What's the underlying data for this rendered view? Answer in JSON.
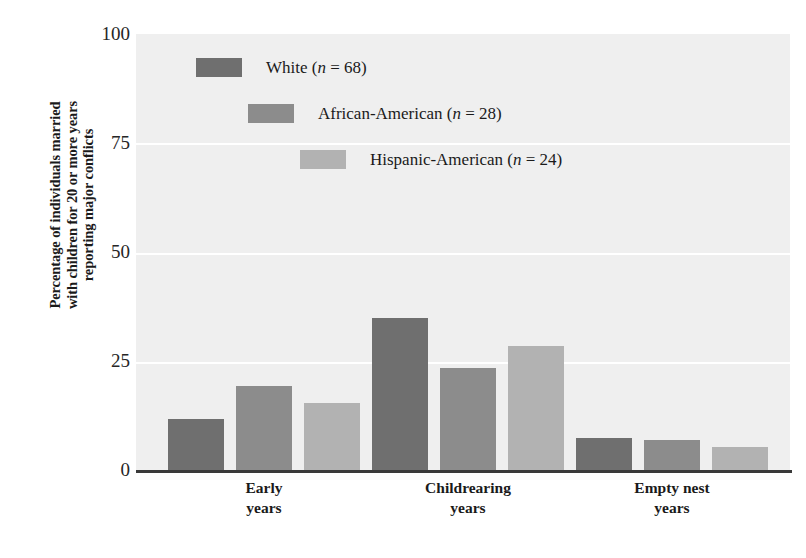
{
  "chart_data": {
    "type": "bar",
    "title": "",
    "subtitle": "",
    "xlabel": "",
    "ylabel": "Percentage of individuals married with children for 20 or more years reporting major conflicts",
    "ylabel_lines": [
      "Percentage of individuals married",
      "with children for 20 or more years",
      "reporting major conflicts"
    ],
    "categories": [
      "Early years",
      "Childrearing years",
      "Empty nest years"
    ],
    "category_lines": [
      [
        "Early",
        "years"
      ],
      [
        "Childrearing",
        "years"
      ],
      [
        "Empty nest",
        "years"
      ]
    ],
    "series": [
      {
        "name": "White (n = 68)",
        "short_name": "White",
        "n": 68,
        "color": "#6f6f6f",
        "values": [
          12,
          35,
          7.5
        ]
      },
      {
        "name": "African-American (n = 28)",
        "short_name": "African-American",
        "n": 28,
        "color": "#8c8c8c",
        "values": [
          19.5,
          23.5,
          7
        ]
      },
      {
        "name": "Hispanic-American (n = 24)",
        "short_name": "Hispanic-American",
        "n": 24,
        "color": "#b2b2b2",
        "values": [
          15.5,
          28.5,
          5.5
        ]
      }
    ],
    "ylim": [
      0,
      100
    ],
    "yticks": [
      0,
      25,
      50,
      75,
      100
    ],
    "ytick_labels": [
      "0",
      "25",
      "50",
      "75",
      "100"
    ],
    "grid": true,
    "grid_color": "#ffffff",
    "plot_background": "#efefef",
    "legend_position": "upper-center-staggered",
    "axis_color": "#3a3a3a"
  },
  "legend": {
    "entries": [
      {
        "prefix": "White ",
        "n_text": "n",
        "eq": " = 68)",
        "open_paren": "(",
        "full": "White (n = 68)"
      },
      {
        "prefix": "African-American ",
        "n_text": "n",
        "eq": " = 28)",
        "open_paren": "(",
        "full": "African-American (n = 28)"
      },
      {
        "prefix": "Hispanic-American ",
        "n_text": "n",
        "eq": " = 24)",
        "open_paren": "(",
        "full": "Hispanic-American (n = 24)"
      }
    ]
  },
  "axis": {
    "ytick_0": "0",
    "ytick_25": "25",
    "ytick_50": "50",
    "ytick_75": "75",
    "ytick_100": "100"
  },
  "ylabel_text": {
    "line1": "Percentage of individuals married",
    "line2": "with children for 20 or more years",
    "line3": "reporting major conflicts"
  },
  "xlabels": {
    "g0_l1": "Early",
    "g0_l2": "years",
    "g1_l1": "Childrearing",
    "g1_l2": "years",
    "g2_l1": "Empty nest",
    "g2_l2": "years"
  }
}
